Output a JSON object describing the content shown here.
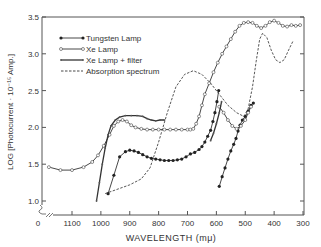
{
  "chart_data": {
    "type": "line",
    "title": "",
    "xlabel": "WAVELENGTH (mμ)",
    "ylabel": "LOG [Photocurrent · 10⁻¹⁵ Amp.]",
    "xlim": [
      1200,
      300
    ],
    "ylim": [
      1.0,
      3.5
    ],
    "x_ticks": [
      "0",
      "1100",
      "1000",
      "900",
      "800",
      "700",
      "600",
      "500",
      "400",
      "300"
    ],
    "y_ticks": [
      "1.0",
      "1.5",
      "2.0",
      "2.5",
      "3.0",
      "3.5"
    ],
    "grid": false,
    "legend_position": "upper left",
    "series": [
      {
        "name": "Tungsten Lamp",
        "marker": "filled-circle",
        "line": "solid",
        "segments": [
          [
            [
              975,
              1.1
            ],
            [
              955,
              1.35
            ],
            [
              935,
              1.6
            ],
            [
              915,
              1.67
            ],
            [
              900,
              1.69
            ],
            [
              885,
              1.68
            ],
            [
              870,
              1.66
            ],
            [
              855,
              1.63
            ],
            [
              840,
              1.6
            ],
            [
              825,
              1.58
            ],
            [
              810,
              1.57
            ],
            [
              795,
              1.56
            ],
            [
              780,
              1.55
            ],
            [
              765,
              1.55
            ],
            [
              750,
              1.55
            ],
            [
              735,
              1.56
            ],
            [
              720,
              1.57
            ],
            [
              705,
              1.6
            ],
            [
              690,
              1.64
            ],
            [
              675,
              1.66
            ],
            [
              660,
              1.7
            ],
            [
              650,
              1.74
            ],
            [
              640,
              1.8
            ],
            [
              630,
              1.88
            ],
            [
              620,
              1.96
            ],
            [
              612,
              2.08
            ],
            [
              605,
              2.2
            ],
            [
              598,
              2.35
            ],
            [
              592,
              2.5
            ]
          ],
          [
            [
              590,
              1.2
            ],
            [
              580,
              1.33
            ],
            [
              570,
              1.45
            ],
            [
              560,
              1.57
            ],
            [
              550,
              1.68
            ],
            [
              540,
              1.77
            ],
            [
              532,
              1.85
            ],
            [
              525,
              1.95
            ],
            [
              518,
              2.03
            ],
            [
              510,
              2.1
            ],
            [
              500,
              2.15
            ],
            [
              490,
              2.22
            ],
            [
              480,
              2.3
            ],
            [
              472,
              2.33
            ]
          ]
        ]
      },
      {
        "name": "Xe Lamp",
        "marker": "open-circle",
        "line": "solid",
        "segments": [
          [
            [
              1180,
              1.46
            ],
            [
              1140,
              1.42
            ],
            [
              1100,
              1.42
            ],
            [
              1060,
              1.46
            ],
            [
              1030,
              1.53
            ],
            [
              1010,
              1.62
            ],
            [
              990,
              1.75
            ],
            [
              970,
              1.9
            ],
            [
              955,
              2.02
            ],
            [
              940,
              2.08
            ],
            [
              925,
              2.1
            ],
            [
              910,
              2.08
            ],
            [
              895,
              2.03
            ],
            [
              880,
              2.0
            ],
            [
              860,
              1.98
            ],
            [
              840,
              1.97
            ],
            [
              820,
              1.97
            ],
            [
              800,
              1.97
            ],
            [
              780,
              1.97
            ],
            [
              760,
              1.97
            ],
            [
              740,
              1.97
            ],
            [
              720,
              1.97
            ],
            [
              700,
              1.97
            ],
            [
              690,
              1.97
            ],
            [
              680,
              1.98
            ],
            [
              670,
              2.05
            ],
            [
              660,
              2.15
            ],
            [
              650,
              2.3
            ],
            [
              640,
              2.45
            ],
            [
              625,
              2.6
            ],
            [
              610,
              2.75
            ],
            [
              595,
              2.88
            ],
            [
              580,
              3.0
            ],
            [
              565,
              3.1
            ],
            [
              550,
              3.2
            ],
            [
              535,
              3.3
            ],
            [
              520,
              3.38
            ],
            [
              505,
              3.42
            ],
            [
              490,
              3.43
            ],
            [
              475,
              3.42
            ],
            [
              460,
              3.38
            ],
            [
              445,
              3.35
            ],
            [
              430,
              3.38
            ],
            [
              415,
              3.43
            ],
            [
              400,
              3.45
            ],
            [
              385,
              3.42
            ],
            [
              370,
              3.38
            ],
            [
              355,
              3.37
            ],
            [
              340,
              3.39
            ],
            [
              325,
              3.38
            ],
            [
              310,
              3.39
            ]
          ],
          [
            [
              590,
              2.28
            ],
            [
              575,
              2.2
            ],
            [
              560,
              2.1
            ],
            [
              545,
              2.02
            ],
            [
              530,
              1.98
            ],
            [
              515,
              2.02
            ],
            [
              500,
              2.1
            ],
            [
              490,
              2.2
            ],
            [
              480,
              2.28
            ]
          ]
        ]
      },
      {
        "name": "Xe Lamp + filter",
        "marker": "small-filled-dot",
        "line": "solid",
        "segments": [
          [
            [
              1015,
              1.0
            ],
            [
              1005,
              1.25
            ],
            [
              995,
              1.5
            ],
            [
              985,
              1.72
            ],
            [
              975,
              1.9
            ],
            [
              965,
              2.02
            ],
            [
              950,
              2.1
            ],
            [
              935,
              2.14
            ],
            [
              915,
              2.16
            ],
            [
              895,
              2.16
            ],
            [
              875,
              2.16
            ],
            [
              855,
              2.15
            ],
            [
              840,
              2.12
            ],
            [
              825,
              2.1
            ],
            [
              810,
              2.09
            ],
            [
              795,
              2.1
            ],
            [
              780,
              2.1
            ]
          ],
          [
            [
              620,
              1.82
            ],
            [
              610,
              1.92
            ],
            [
              600,
              2.05
            ],
            [
              590,
              2.2
            ],
            [
              582,
              2.35
            ]
          ]
        ]
      },
      {
        "name": "Absorption spectrum",
        "marker": "none",
        "line": "dashed",
        "segments": [
          [
            [
              985,
              1.1
            ],
            [
              950,
              1.15
            ],
            [
              900,
              1.22
            ],
            [
              860,
              1.3
            ],
            [
              830,
              1.45
            ],
            [
              800,
              1.8
            ],
            [
              770,
              2.2
            ],
            [
              740,
              2.55
            ],
            [
              710,
              2.72
            ],
            [
              680,
              2.77
            ],
            [
              650,
              2.72
            ],
            [
              620,
              2.6
            ],
            [
              590,
              2.45
            ],
            [
              560,
              2.3
            ],
            [
              530,
              2.2
            ],
            [
              505,
              2.15
            ],
            [
              490,
              2.25
            ],
            [
              475,
              2.55
            ],
            [
              462,
              2.9
            ],
            [
              450,
              3.2
            ],
            [
              440,
              3.28
            ],
            [
              425,
              3.22
            ],
            [
              410,
              3.05
            ],
            [
              395,
              2.92
            ],
            [
              380,
              2.88
            ],
            [
              365,
              2.92
            ],
            [
              350,
              3.05
            ],
            [
              335,
              3.17
            ]
          ]
        ]
      }
    ]
  },
  "legend": {
    "items": [
      "Tungsten Lamp",
      "Xe Lamp",
      "Xe Lamp + filter",
      "Absorption spectrum"
    ]
  },
  "axes": {
    "xlabel": "WAVELENGTH (mμ)",
    "ylabel": "LOG [Photocurrent · 10⁻¹⁵ Amp.]"
  }
}
